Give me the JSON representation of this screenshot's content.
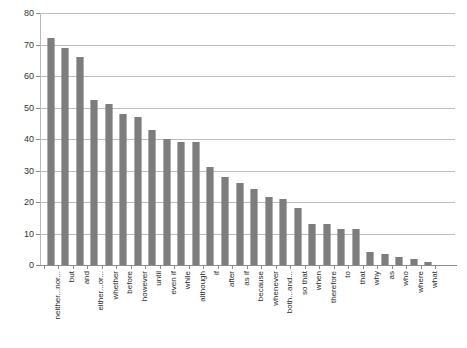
{
  "chart_data": {
    "type": "bar",
    "title": "",
    "subtitle": "",
    "xlabel": "",
    "ylabel": "",
    "ylim": [
      0,
      80
    ],
    "yticks": [
      0,
      10,
      20,
      30,
      40,
      50,
      60,
      70,
      80
    ],
    "grid": true,
    "legend": false,
    "legend_position": "none",
    "orientation": "vertical",
    "bar_color": "#808080",
    "bar_pattern": "dithered-gray-checker",
    "categories": [
      "neither...nor...",
      "but",
      "and",
      "either...or...",
      "whether",
      "before",
      "however",
      "until",
      "even if",
      "while",
      "although",
      "if",
      "after",
      "as if",
      "because",
      "whenever",
      "both...and...",
      "so that",
      "when",
      "therefore",
      "to",
      "that",
      "why",
      "as",
      "who",
      "where",
      "what"
    ],
    "values": [
      72,
      69,
      66,
      52.5,
      51,
      48,
      47,
      43,
      40,
      39,
      39,
      31,
      28,
      26,
      24,
      21.5,
      21,
      18,
      13,
      13,
      11.5,
      11.5,
      4,
      3.5,
      2.5,
      2,
      1
    ]
  }
}
